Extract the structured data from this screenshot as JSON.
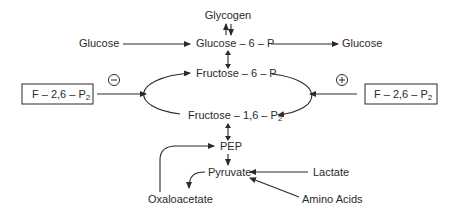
{
  "diagram": {
    "nodes": {
      "glycogen": "Glycogen",
      "glucose_left": "Glucose",
      "glucose_6_p": "Glucose – 6 – P",
      "glucose_right": "Glucose",
      "fructose_6_p": "Fructose – 6 – P",
      "fructose_16_p2": "Fructose – 1,6 – P",
      "fructose_16_p2_sub": "2",
      "pep": "PEP",
      "pyruvate": "Pyruvate",
      "lactate": "Lactate",
      "amino_acids": "Amino Acids",
      "oxaloacetate": "Oxaloacetate"
    },
    "regulators": {
      "left": {
        "label": "F – 2,6 – P",
        "sub": "2",
        "effect": "−"
      },
      "right": {
        "label": "F – 2,6 – P",
        "sub": "2",
        "effect": "+"
      }
    },
    "edges": [
      {
        "from": "Glucose",
        "to": "Glucose – 6 – P"
      },
      {
        "from": "Glucose – 6 – P",
        "to": "Glucose"
      },
      {
        "from": "Glycogen",
        "to": "Glucose – 6 – P",
        "bidirectional": true
      },
      {
        "from": "Glucose – 6 – P",
        "to": "Fructose – 6 – P",
        "bidirectional": true
      },
      {
        "from": "Fructose – 6 – P",
        "to": "Fructose – 1,6 – P2",
        "cycle": true
      },
      {
        "from": "Fructose – 1,6 – P2",
        "to": "PEP",
        "bidirectional": true
      },
      {
        "from": "PEP",
        "to": "Pyruvate"
      },
      {
        "from": "Lactate",
        "to": "Pyruvate"
      },
      {
        "from": "Amino Acids",
        "to": "Pyruvate"
      },
      {
        "from": "Pyruvate",
        "to": "Oxaloacetate"
      },
      {
        "from": "Oxaloacetate",
        "to": "PEP"
      },
      {
        "from": "F – 2,6 – P2 (left)",
        "to": "cycle",
        "effect": "inhibit"
      },
      {
        "from": "F – 2,6 – P2 (right)",
        "to": "cycle",
        "effect": "activate"
      }
    ]
  }
}
